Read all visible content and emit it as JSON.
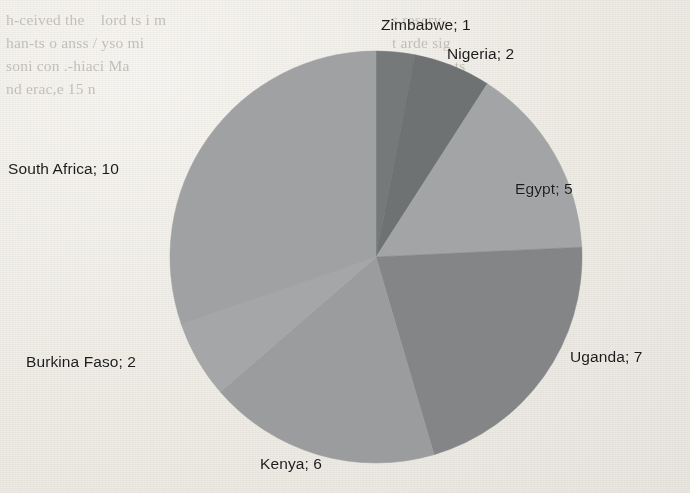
{
  "document": {
    "kind": "scanned-page-with-pie-chart",
    "background_ghost_text": {
      "left_column": "h-ceived the    lord ts i m\nhan-ts o anss / yso mi\nsoni con .-hiaci Ma\nnd erac,e 15 n",
      "right_column": "s rescrv-\nt arde sig\nspp, unar ts\nngs ngs ta\nerw- f92 1",
      "mid_column": "ss oaa;st and vaersr cu rr\ns     sss\n(      )\ny      ony",
      "low_column": "s aer\nurd i\nermi\n   r\nnose\nbec\nelp\n:0"
    }
  },
  "chart_data": {
    "type": "pie",
    "title": "",
    "categories": [
      "Zimbabwe",
      "Nigeria",
      "Egypt",
      "Uganda",
      "Kenya",
      "Burkina Faso",
      "South Africa"
    ],
    "values": [
      1,
      2,
      5,
      7,
      6,
      2,
      10
    ],
    "total": 33,
    "label_format": "{name}; {value}",
    "labels": [
      "Zimbabwe; 1",
      "Nigeria; 2",
      "Egypt; 5",
      "Uganda; 7",
      "Kenya; 6",
      "Burkina Faso; 2",
      "South Africa; 10"
    ],
    "slice_colors": [
      "#77797a",
      "#9b9d9e",
      "#a9abac",
      "#848687",
      "#9a9c9d",
      "#9fa1a2",
      "#a3a5a6"
    ],
    "start_angle_deg": 0,
    "direction": "clockwise",
    "legend": "none",
    "data_labels_outside": true,
    "grid": false
  },
  "pie": {
    "center_x": 207,
    "center_y": 207,
    "radius": 206,
    "slices": [
      {
        "name": "Zimbabwe",
        "value": 1,
        "start_deg": 0,
        "end_deg": 10.909,
        "color": "#76797a"
      },
      {
        "name": "Nigeria",
        "value": 2,
        "start_deg": 10.909,
        "end_deg": 32.727,
        "color": "#6f7273"
      },
      {
        "name": "Egypt",
        "value": 5,
        "start_deg": 32.727,
        "end_deg": 87.273,
        "color": "#a2a4a5"
      },
      {
        "name": "Uganda",
        "value": 7,
        "start_deg": 87.273,
        "end_deg": 163.636,
        "color": "#838586"
      },
      {
        "name": "Kenya",
        "value": 6,
        "start_deg": 163.636,
        "end_deg": 229.091,
        "color": "#9a9c9d"
      },
      {
        "name": "Burkina Faso",
        "value": 2,
        "start_deg": 229.091,
        "end_deg": 250.909,
        "color": "#a4a6a7"
      },
      {
        "name": "South Africa",
        "value": 10,
        "start_deg": 250.909,
        "end_deg": 360,
        "color": "#9fa1a2"
      }
    ]
  },
  "labels": {
    "zimbabwe": "Zimbabwe; 1",
    "nigeria": "Nigeria; 2",
    "egypt": "Egypt; 5",
    "uganda": "Uganda; 7",
    "kenya": "Kenya; 6",
    "burkina_faso": "Burkina Faso; 2",
    "south_africa": "South Africa; 10"
  }
}
